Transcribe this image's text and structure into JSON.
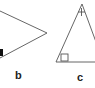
{
  "diagram": {
    "type": "geometry-triangles",
    "stroke_color": "#555555",
    "mark_color": "#111111",
    "figures": [
      {
        "id": "b",
        "label": "b",
        "shape": "triangle (partially cropped)",
        "markings": [
          "right-angle square (partial, lower-left)"
        ]
      },
      {
        "id": "c",
        "label": "c",
        "shape": "triangle (partially cropped)",
        "markings": [
          "tick mark at apex",
          "right-angle square at bottom-left"
        ]
      }
    ]
  }
}
